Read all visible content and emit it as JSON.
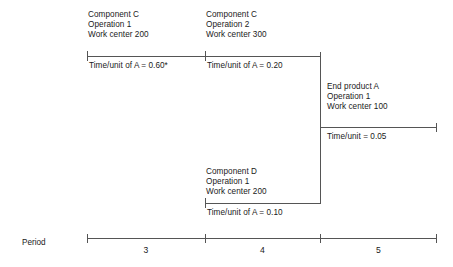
{
  "figure": {
    "type": "gantt-routing-timeline",
    "axis_label": "Period"
  },
  "operations": [
    {
      "id": "component-c-op1",
      "item": "Component C",
      "operation": "Operation 1",
      "work_center": "Work center 200",
      "time": "Time/unit of A = 0.60*",
      "period_span": "3"
    },
    {
      "id": "component-c-op2",
      "item": "Component C",
      "operation": "Operation 2",
      "work_center": "Work center 300",
      "time": "Time/unit of A = 0.20",
      "period_span": "4"
    },
    {
      "id": "end-product-a-op1",
      "item": "End product A",
      "operation": "Operation 1",
      "work_center": "Work center 100",
      "time": "Time/unit = 0.05",
      "period_span": "5"
    },
    {
      "id": "component-d-op1",
      "item": "Component D",
      "operation": "Operation 1",
      "work_center": "Work center 200",
      "time": "Time/unit of A = 0.10",
      "period_span": "4"
    }
  ],
  "period_axis": {
    "label": "Period",
    "periods": [
      "3",
      "4",
      "5"
    ]
  }
}
